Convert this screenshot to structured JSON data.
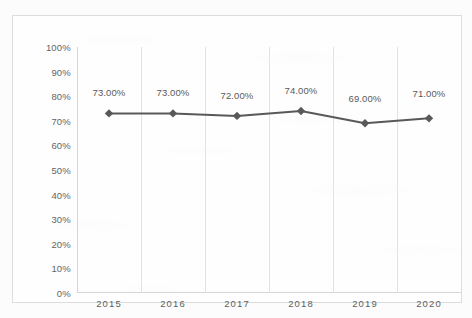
{
  "chart_data": {
    "type": "line",
    "title": "",
    "subtitle": "",
    "xlabel": "",
    "ylabel": "",
    "categories": [
      "2015",
      "2016",
      "2017",
      "2018",
      "2019",
      "2020"
    ],
    "values": [
      73,
      73,
      72,
      74,
      69,
      71
    ],
    "data_labels": [
      "73.00%",
      "73.00%",
      "72.00%",
      "74.00%",
      "69.00%",
      "71.00%"
    ],
    "ylim": [
      0,
      100
    ],
    "ytick_labels": [
      "100%",
      "90%",
      "80%",
      "70%",
      "60%",
      "50%",
      "40%",
      "30%",
      "20%",
      "10%",
      "0%"
    ],
    "ytick_values": [
      100,
      90,
      80,
      70,
      60,
      50,
      40,
      30,
      20,
      10,
      0
    ],
    "grid": {
      "vertical": true,
      "horizontal": false
    },
    "legend": {
      "visible": false,
      "position": "none",
      "entries": []
    },
    "series": [
      {
        "name": "",
        "values": [
          73,
          73,
          72,
          74,
          69,
          71
        ],
        "line_color": "#595959",
        "marker": "diamond",
        "marker_color": "#595959"
      }
    ],
    "annotations": []
  },
  "colors": {
    "page_background": "#fcfcfc",
    "frame_border": "#dcdcdc",
    "axis_line": "#d6d6d6",
    "gridline": "#e2e2e2",
    "series_line": "#595959",
    "tick_text": "#646464",
    "label_text": "#5a5a5a"
  },
  "caption": {
    "text": ""
  }
}
